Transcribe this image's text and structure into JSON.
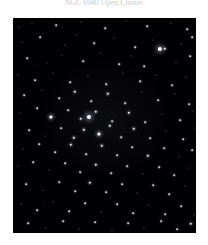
{
  "caption": {
    "text": "NGC 6940 Open Cluster"
  },
  "image": {
    "kind": "astronomical-star-field",
    "frame": {
      "x": 13,
      "y": 18,
      "width": 183,
      "height": 215
    },
    "background_color": "#000000",
    "star_color": "#ffffff",
    "page_background": "#ffffff",
    "caption_color": "#c9c9c9"
  },
  "chart_data": {
    "type": "scatter",
    "title": "NGC 6940 Open Cluster",
    "xlabel": "",
    "ylabel": "",
    "xlim": [
      0,
      183
    ],
    "ylim": [
      0,
      215
    ],
    "grid": false,
    "legend": null,
    "note": "Star positions in frame pixel coordinates; size = apparent brightness (1 faint - 5 brightest).",
    "stars": [
      {
        "x": 6,
        "y": 9,
        "mag": 1
      },
      {
        "x": 19,
        "y": 5,
        "mag": 1
      },
      {
        "x": 43,
        "y": 7,
        "mag": 2
      },
      {
        "x": 68,
        "y": 4,
        "mag": 1
      },
      {
        "x": 92,
        "y": 10,
        "mag": 2
      },
      {
        "x": 113,
        "y": 3,
        "mag": 1
      },
      {
        "x": 134,
        "y": 8,
        "mag": 2
      },
      {
        "x": 158,
        "y": 5,
        "mag": 1
      },
      {
        "x": 174,
        "y": 11,
        "mag": 2
      },
      {
        "x": 9,
        "y": 24,
        "mag": 1
      },
      {
        "x": 27,
        "y": 19,
        "mag": 2
      },
      {
        "x": 52,
        "y": 27,
        "mag": 1
      },
      {
        "x": 64,
        "y": 17,
        "mag": 1
      },
      {
        "x": 81,
        "y": 25,
        "mag": 2
      },
      {
        "x": 101,
        "y": 20,
        "mag": 1
      },
      {
        "x": 122,
        "y": 29,
        "mag": 2
      },
      {
        "x": 140,
        "y": 22,
        "mag": 1
      },
      {
        "x": 152,
        "y": 31,
        "mag": 3
      },
      {
        "x": 168,
        "y": 26,
        "mag": 1
      },
      {
        "x": 179,
        "y": 19,
        "mag": 2
      },
      {
        "x": 14,
        "y": 40,
        "mag": 2
      },
      {
        "x": 34,
        "y": 45,
        "mag": 1
      },
      {
        "x": 49,
        "y": 37,
        "mag": 1
      },
      {
        "x": 70,
        "y": 43,
        "mag": 2
      },
      {
        "x": 88,
        "y": 35,
        "mag": 1
      },
      {
        "x": 106,
        "y": 46,
        "mag": 2
      },
      {
        "x": 118,
        "y": 38,
        "mag": 1
      },
      {
        "x": 131,
        "y": 48,
        "mag": 2
      },
      {
        "x": 147,
        "y": 31,
        "mag": 5
      },
      {
        "x": 163,
        "y": 44,
        "mag": 1
      },
      {
        "x": 177,
        "y": 38,
        "mag": 2
      },
      {
        "x": 5,
        "y": 57,
        "mag": 1
      },
      {
        "x": 22,
        "y": 62,
        "mag": 2
      },
      {
        "x": 40,
        "y": 55,
        "mag": 1
      },
      {
        "x": 57,
        "y": 64,
        "mag": 2
      },
      {
        "x": 75,
        "y": 58,
        "mag": 1
      },
      {
        "x": 93,
        "y": 66,
        "mag": 2
      },
      {
        "x": 110,
        "y": 55,
        "mag": 1
      },
      {
        "x": 127,
        "y": 63,
        "mag": 2
      },
      {
        "x": 143,
        "y": 57,
        "mag": 1
      },
      {
        "x": 159,
        "y": 67,
        "mag": 2
      },
      {
        "x": 173,
        "y": 59,
        "mag": 1
      },
      {
        "x": 11,
        "y": 77,
        "mag": 2
      },
      {
        "x": 29,
        "y": 72,
        "mag": 1
      },
      {
        "x": 46,
        "y": 80,
        "mag": 2
      },
      {
        "x": 62,
        "y": 74,
        "mag": 3
      },
      {
        "x": 78,
        "y": 83,
        "mag": 2
      },
      {
        "x": 95,
        "y": 76,
        "mag": 3
      },
      {
        "x": 112,
        "y": 85,
        "mag": 2
      },
      {
        "x": 129,
        "y": 74,
        "mag": 1
      },
      {
        "x": 145,
        "y": 82,
        "mag": 2
      },
      {
        "x": 162,
        "y": 76,
        "mag": 1
      },
      {
        "x": 176,
        "y": 86,
        "mag": 2
      },
      {
        "x": 7,
        "y": 95,
        "mag": 1
      },
      {
        "x": 24,
        "y": 90,
        "mag": 2
      },
      {
        "x": 38,
        "y": 99,
        "mag": 4
      },
      {
        "x": 55,
        "y": 92,
        "mag": 2
      },
      {
        "x": 68,
        "y": 101,
        "mag": 3
      },
      {
        "x": 83,
        "y": 94,
        "mag": 3
      },
      {
        "x": 99,
        "y": 103,
        "mag": 2
      },
      {
        "x": 116,
        "y": 95,
        "mag": 3
      },
      {
        "x": 132,
        "y": 104,
        "mag": 2
      },
      {
        "x": 149,
        "y": 96,
        "mag": 1
      },
      {
        "x": 167,
        "y": 102,
        "mag": 2
      },
      {
        "x": 180,
        "y": 93,
        "mag": 1
      },
      {
        "x": 16,
        "y": 112,
        "mag": 2
      },
      {
        "x": 32,
        "y": 118,
        "mag": 1
      },
      {
        "x": 48,
        "y": 110,
        "mag": 2
      },
      {
        "x": 61,
        "y": 120,
        "mag": 3
      },
      {
        "x": 71,
        "y": 112,
        "mag": 3
      },
      {
        "x": 76,
        "y": 99,
        "mag": 5
      },
      {
        "x": 86,
        "y": 116,
        "mag": 4
      },
      {
        "x": 97,
        "y": 108,
        "mag": 3
      },
      {
        "x": 108,
        "y": 119,
        "mag": 2
      },
      {
        "x": 121,
        "y": 111,
        "mag": 3
      },
      {
        "x": 137,
        "y": 120,
        "mag": 2
      },
      {
        "x": 153,
        "y": 113,
        "mag": 1
      },
      {
        "x": 170,
        "y": 121,
        "mag": 2
      },
      {
        "x": 182,
        "y": 110,
        "mag": 1
      },
      {
        "x": 10,
        "y": 131,
        "mag": 1
      },
      {
        "x": 26,
        "y": 126,
        "mag": 2
      },
      {
        "x": 42,
        "y": 134,
        "mag": 2
      },
      {
        "x": 58,
        "y": 127,
        "mag": 3
      },
      {
        "x": 73,
        "y": 136,
        "mag": 2
      },
      {
        "x": 89,
        "y": 128,
        "mag": 3
      },
      {
        "x": 104,
        "y": 137,
        "mag": 2
      },
      {
        "x": 119,
        "y": 129,
        "mag": 2
      },
      {
        "x": 135,
        "y": 138,
        "mag": 3
      },
      {
        "x": 151,
        "y": 130,
        "mag": 2
      },
      {
        "x": 166,
        "y": 139,
        "mag": 1
      },
      {
        "x": 179,
        "y": 132,
        "mag": 2
      },
      {
        "x": 5,
        "y": 148,
        "mag": 1
      },
      {
        "x": 20,
        "y": 144,
        "mag": 2
      },
      {
        "x": 36,
        "y": 152,
        "mag": 1
      },
      {
        "x": 52,
        "y": 145,
        "mag": 2
      },
      {
        "x": 67,
        "y": 154,
        "mag": 2
      },
      {
        "x": 83,
        "y": 147,
        "mag": 3
      },
      {
        "x": 98,
        "y": 155,
        "mag": 2
      },
      {
        "x": 114,
        "y": 148,
        "mag": 2
      },
      {
        "x": 130,
        "y": 156,
        "mag": 1
      },
      {
        "x": 146,
        "y": 149,
        "mag": 2
      },
      {
        "x": 161,
        "y": 157,
        "mag": 2
      },
      {
        "x": 176,
        "y": 150,
        "mag": 1
      },
      {
        "x": 13,
        "y": 166,
        "mag": 2
      },
      {
        "x": 30,
        "y": 172,
        "mag": 1
      },
      {
        "x": 46,
        "y": 164,
        "mag": 2
      },
      {
        "x": 62,
        "y": 173,
        "mag": 2
      },
      {
        "x": 77,
        "y": 165,
        "mag": 3
      },
      {
        "x": 93,
        "y": 174,
        "mag": 2
      },
      {
        "x": 109,
        "y": 166,
        "mag": 2
      },
      {
        "x": 124,
        "y": 175,
        "mag": 1
      },
      {
        "x": 140,
        "y": 167,
        "mag": 2
      },
      {
        "x": 156,
        "y": 176,
        "mag": 2
      },
      {
        "x": 172,
        "y": 168,
        "mag": 1
      },
      {
        "x": 8,
        "y": 186,
        "mag": 1
      },
      {
        "x": 24,
        "y": 192,
        "mag": 2
      },
      {
        "x": 40,
        "y": 184,
        "mag": 1
      },
      {
        "x": 56,
        "y": 193,
        "mag": 2
      },
      {
        "x": 72,
        "y": 185,
        "mag": 2
      },
      {
        "x": 88,
        "y": 194,
        "mag": 1
      },
      {
        "x": 104,
        "y": 186,
        "mag": 2
      },
      {
        "x": 120,
        "y": 195,
        "mag": 2
      },
      {
        "x": 136,
        "y": 187,
        "mag": 1
      },
      {
        "x": 152,
        "y": 196,
        "mag": 2
      },
      {
        "x": 168,
        "y": 188,
        "mag": 2
      },
      {
        "x": 181,
        "y": 197,
        "mag": 1
      },
      {
        "x": 15,
        "y": 205,
        "mag": 2
      },
      {
        "x": 33,
        "y": 210,
        "mag": 1
      },
      {
        "x": 50,
        "y": 203,
        "mag": 2
      },
      {
        "x": 66,
        "y": 211,
        "mag": 1
      },
      {
        "x": 82,
        "y": 204,
        "mag": 2
      },
      {
        "x": 99,
        "y": 212,
        "mag": 1
      },
      {
        "x": 115,
        "y": 205,
        "mag": 2
      },
      {
        "x": 131,
        "y": 210,
        "mag": 1
      },
      {
        "x": 148,
        "y": 203,
        "mag": 2
      },
      {
        "x": 164,
        "y": 211,
        "mag": 2
      },
      {
        "x": 178,
        "y": 206,
        "mag": 3
      }
    ]
  }
}
